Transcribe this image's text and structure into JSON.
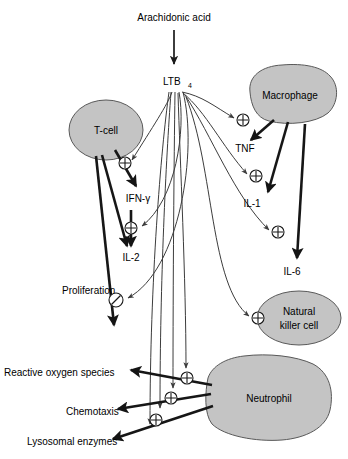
{
  "diagram": {
    "type": "biological-pathway-diagram",
    "width": 348,
    "height": 459,
    "background_color": "#ffffff",
    "cell_fill_color": "#c4c4c4",
    "cell_stroke_color": "#595959",
    "arrow_color": "#1a1a1a",
    "thin_arrow_color": "#3c3c3c"
  },
  "nodes": {
    "arachidonic_acid": {
      "label": "Arachidonic acid",
      "x": 174,
      "y": 17,
      "kind": "molecule-label"
    },
    "ltb4": {
      "label": "LTB",
      "subscript": "4",
      "x": 174,
      "y": 81,
      "kind": "molecule-label"
    },
    "t_cell": {
      "label": "T-cell",
      "x": 106,
      "y": 130,
      "kind": "cell",
      "shape": "ellipse"
    },
    "macrophage": {
      "label": "Macrophage",
      "x": 287,
      "y": 95,
      "kind": "cell",
      "shape": "blob"
    },
    "natural_killer_cell": {
      "label_line1": "Natural",
      "label_line2": "killer cell",
      "x": 296,
      "y": 318,
      "kind": "cell",
      "shape": "ellipse"
    },
    "neutrophil": {
      "label": "Neutrophil",
      "x": 263,
      "y": 398,
      "kind": "cell",
      "shape": "blob"
    },
    "ifn_gamma": {
      "label": "IFN-γ",
      "x": 138,
      "y": 198,
      "kind": "mediator"
    },
    "il_2": {
      "label": "IL-2",
      "x": 131,
      "y": 257,
      "kind": "mediator"
    },
    "proliferation": {
      "label": "Proliferation",
      "x": 62,
      "y": 290,
      "kind": "outcome"
    },
    "tnf": {
      "label": "TNF",
      "x": 245,
      "y": 148,
      "kind": "mediator"
    },
    "il_1": {
      "label": "IL-1",
      "x": 250,
      "y": 203,
      "kind": "mediator"
    },
    "il_6": {
      "label": "IL-6",
      "x": 290,
      "y": 271,
      "kind": "mediator"
    },
    "reactive_oxygen_species": {
      "label": "Reactive oxygen species",
      "x": 4,
      "y": 372,
      "kind": "outcome"
    },
    "chemotaxis": {
      "label": "Chemotaxis",
      "x": 66,
      "y": 411,
      "kind": "outcome"
    },
    "lysosomal_enzymes": {
      "label": "Lysosomal enzymes",
      "x": 27,
      "y": 441,
      "kind": "outcome"
    }
  },
  "symbols": {
    "activation": {
      "glyph": "plus-in-circle-icon",
      "meaning": "stimulation / activation"
    },
    "inhibition": {
      "glyph": "slash-in-circle-icon",
      "meaning": "inhibition / block"
    },
    "activation_markers": [
      {
        "id": "plus-tcell",
        "x": 125,
        "y": 163,
        "target": "T-cell IFN-gamma release"
      },
      {
        "id": "plus-il2",
        "x": 131,
        "y": 228,
        "target": "IL-2 production"
      },
      {
        "id": "plus-macrophage",
        "x": 243,
        "y": 120,
        "target": "Macrophage TNF release"
      },
      {
        "id": "plus-tnf",
        "x": 256,
        "y": 176,
        "target": "IL-1 production"
      },
      {
        "id": "plus-il1",
        "x": 278,
        "y": 232,
        "target": "IL-6 production"
      },
      {
        "id": "plus-nk",
        "x": 258,
        "y": 318,
        "target": "Natural killer cell activation"
      },
      {
        "id": "plus-ros",
        "x": 187,
        "y": 378,
        "target": "Reactive oxygen species"
      },
      {
        "id": "plus-chemo",
        "x": 171,
        "y": 398,
        "target": "Chemotaxis"
      },
      {
        "id": "plus-lyso",
        "x": 156,
        "y": 420,
        "target": "Lysosomal enzymes"
      }
    ],
    "inhibition_markers": [
      {
        "id": "no-proliferation",
        "x": 116,
        "y": 300,
        "target": "Proliferation"
      }
    ]
  },
  "edges": [
    {
      "from": "arachidonic_acid",
      "to": "ltb4",
      "type": "conversion"
    },
    {
      "from": "ltb4",
      "to": "t_cell",
      "type": "activation"
    },
    {
      "from": "ltb4",
      "to": "macrophage",
      "type": "activation"
    },
    {
      "from": "ltb4",
      "to": "tnf",
      "type": "activation"
    },
    {
      "from": "ltb4",
      "to": "il_1",
      "type": "activation"
    },
    {
      "from": "ltb4",
      "to": "natural_killer_cell",
      "type": "activation"
    },
    {
      "from": "ltb4",
      "to": "neutrophil",
      "type": "activation"
    },
    {
      "from": "ltb4",
      "to": "il_2",
      "type": "activation"
    },
    {
      "from": "t_cell",
      "to": "ifn_gamma",
      "type": "production"
    },
    {
      "from": "t_cell",
      "to": "il_2",
      "type": "production"
    },
    {
      "from": "t_cell",
      "to": "proliferation",
      "type": "production"
    },
    {
      "from": "il_2",
      "to": "proliferation",
      "type": "inhibition"
    },
    {
      "from": "macrophage",
      "to": "tnf",
      "type": "production"
    },
    {
      "from": "macrophage",
      "to": "il_1",
      "type": "production"
    },
    {
      "from": "macrophage",
      "to": "il_6",
      "type": "production"
    },
    {
      "from": "neutrophil",
      "to": "reactive_oxygen_species",
      "type": "production"
    },
    {
      "from": "neutrophil",
      "to": "chemotaxis",
      "type": "production"
    },
    {
      "from": "neutrophil",
      "to": "lysosomal_enzymes",
      "type": "production"
    }
  ]
}
